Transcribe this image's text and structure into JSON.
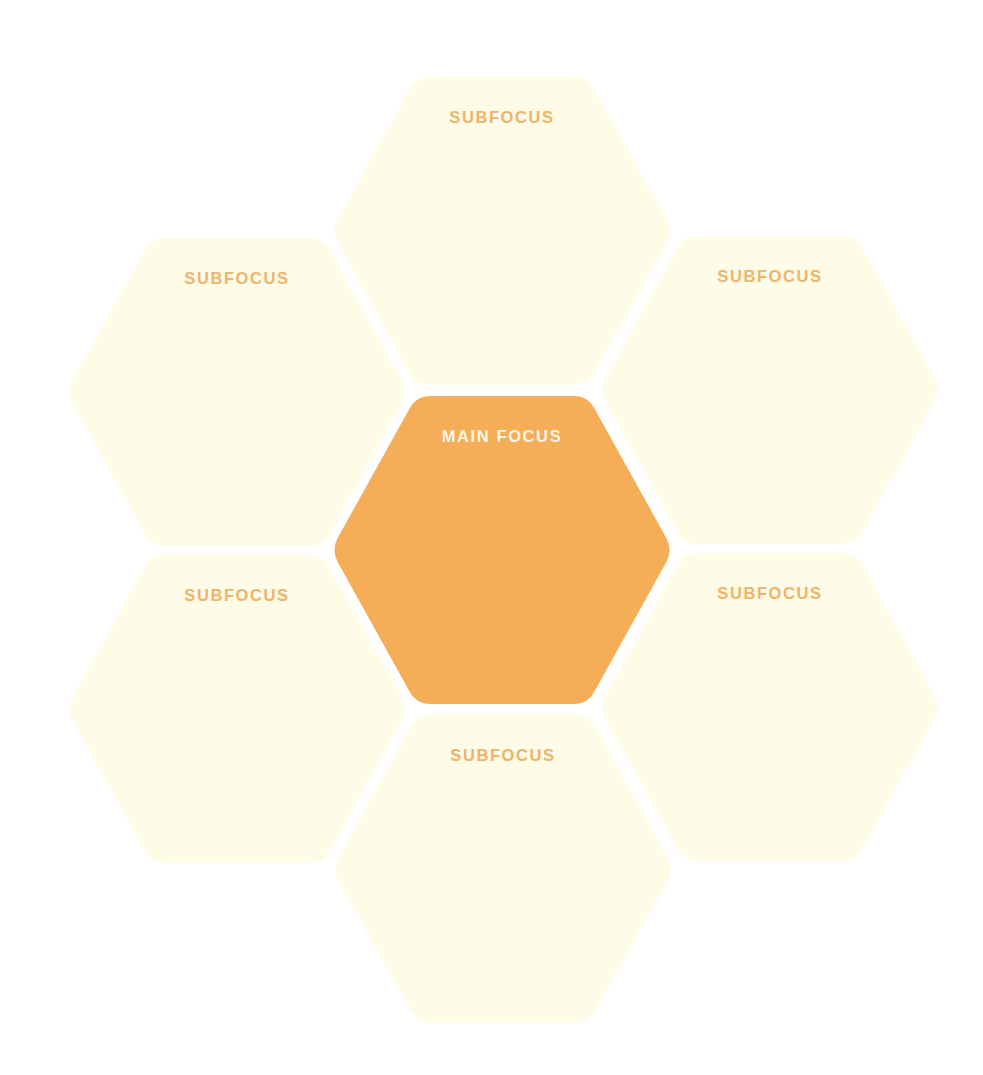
{
  "diagram": {
    "type": "hexagon-cluster",
    "colors": {
      "background": "#ffffff",
      "main_fill": "#f6ad58",
      "main_text": "#fdf6e3",
      "sub_fill": "#fefbe6",
      "sub_text": "#eeb46c"
    },
    "main": {
      "label": "MAIN FOCUS",
      "cx": 502,
      "cy": 550
    },
    "subs": [
      {
        "position": "top",
        "label": "SUBFOCUS",
        "cx": 502,
        "cy": 231
      },
      {
        "position": "upper-left",
        "label": "SUBFOCUS",
        "cx": 237,
        "cy": 392
      },
      {
        "position": "upper-right",
        "label": "SUBFOCUS",
        "cx": 770,
        "cy": 390
      },
      {
        "position": "lower-left",
        "label": "SUBFOCUS",
        "cx": 237,
        "cy": 709
      },
      {
        "position": "lower-right",
        "label": "SUBFOCUS",
        "cx": 770,
        "cy": 707
      },
      {
        "position": "bottom",
        "label": "SUBFOCUS",
        "cx": 503,
        "cy": 869
      }
    ],
    "hex_size": {
      "half_width": 171,
      "half_height": 154,
      "corner_radius": 14,
      "label_offset": 40
    }
  }
}
